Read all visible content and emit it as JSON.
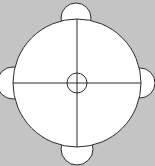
{
  "diagram": {
    "title": "",
    "colors": {
      "background": "#c4c4c4",
      "fill": "#ffffff",
      "stroke": "#2a2a2a"
    },
    "main_circle": {
      "cx": 77,
      "cy": 83,
      "r": 64
    },
    "center_circle": {
      "cx": 77,
      "cy": 83,
      "r": 10
    },
    "lobes": [
      {
        "position": "top",
        "cx": 76,
        "cy": 18,
        "r": 15
      },
      {
        "position": "right",
        "cx": 140,
        "cy": 83,
        "r": 15
      },
      {
        "position": "bottom",
        "cx": 77,
        "cy": 149,
        "r": 16
      },
      {
        "position": "left",
        "cx": 13,
        "cy": 83,
        "r": 16
      }
    ]
  }
}
